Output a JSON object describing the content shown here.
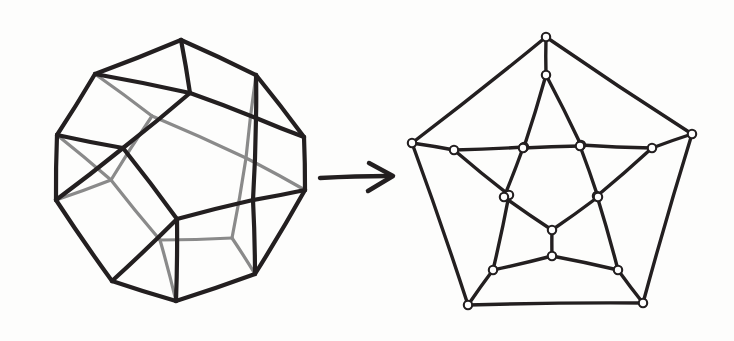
{
  "figure": {
    "background_color": "#fdfdfc",
    "ink_color": "#231f20",
    "hidden_edge_color": "#8a8a8a",
    "node_fill_color": "#ffffff",
    "style": "hand-drawn ink sketch",
    "width": 734,
    "height": 341
  },
  "left_figure": {
    "name": "dodecahedron-solid",
    "label": "dodecahedron",
    "vertex_count": 20,
    "edge_count": 30,
    "face_count": 12,
    "visible_stroke_width": 4.2,
    "hidden_stroke_width": 3.2,
    "vertices": {
      "front_pentagon": [
        [
          190,
          93
        ],
        [
          256,
          118
        ],
        [
          253,
          200
        ],
        [
          177,
          219
        ],
        [
          123,
          148
        ]
      ],
      "outer_ring_upper": [
        [
          181,
          40
        ],
        [
          95,
          74
        ],
        [
          57,
          135
        ],
        [
          56,
          200
        ],
        [
          112,
          281
        ],
        [
          176,
          301
        ],
        [
          255,
          274
        ],
        [
          305,
          190
        ],
        [
          304,
          137
        ],
        [
          256,
          75
        ]
      ],
      "back_pentagon": [
        [
          152,
          116
        ],
        [
          111,
          180
        ],
        [
          160,
          240
        ],
        [
          232,
          238
        ],
        [
          246,
          158
        ]
      ]
    },
    "hidden_edges_note": "rear edges drawn in lighter gray"
  },
  "arrow": {
    "name": "transformation-arrow",
    "direction": "right",
    "x_start": 320,
    "x_end": 393,
    "y": 177,
    "stroke_width": 4.5
  },
  "right_figure": {
    "name": "schlegel-diagram",
    "label": "Schlegel diagram (planar graph)",
    "vertex_count": 20,
    "edge_count": 30,
    "face_count": 12,
    "stroke_width": 3.4,
    "node_radius": 4.2,
    "rings": {
      "outer_pentagon": [
        [
          546,
          37
        ],
        [
          692,
          134
        ],
        [
          643,
          303
        ],
        [
          468,
          305
        ],
        [
          412,
          143
        ]
      ],
      "second_ring": [
        [
          546,
          75
        ],
        [
          652,
          148
        ],
        [
          618,
          270
        ],
        [
          493,
          270
        ],
        [
          454,
          150
        ]
      ],
      "third_ring": [
        [
          581,
          145
        ],
        [
          597,
          196
        ],
        [
          552,
          256
        ],
        [
          509,
          195
        ],
        [
          524,
          147
        ]
      ],
      "inner_pentagon": [
        [
          552,
          230
        ],
        [
          504,
          197
        ],
        [
          523,
          148
        ],
        [
          580,
          146
        ],
        [
          598,
          197
        ]
      ]
    }
  },
  "annotations": {
    "visible_edges_label": "visible edges",
    "hidden_edges_label": "hidden edges",
    "node_label": "vertex"
  }
}
